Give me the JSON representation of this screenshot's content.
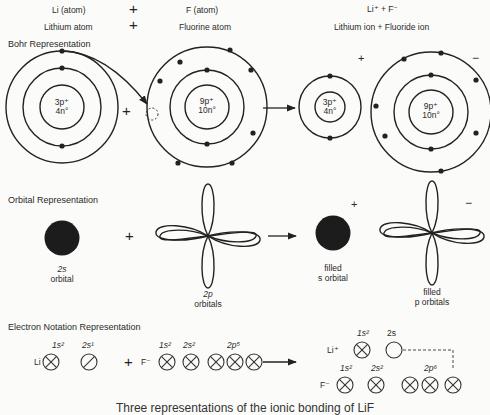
{
  "header": {
    "row1": {
      "reactant1": "Li (atom)",
      "plus": "+",
      "reactant2": "F (atom)",
      "product": "Li⁺ + F⁻"
    },
    "row2": {
      "reactant1": "Lithium atom",
      "plus": "+",
      "reactant2": "Fluorine atom",
      "product": "Lithium ion  +  Fluoride ion"
    }
  },
  "bohr": {
    "title": "Bohr Representation",
    "plus": "+",
    "li_atom": {
      "protons": "3p⁺",
      "neutrons": "4n°"
    },
    "f_atom": {
      "protons": "9p⁺",
      "neutrons": "10n°"
    },
    "li_ion": {
      "protons": "3p⁺",
      "neutrons": "4n°",
      "charge": "+"
    },
    "f_ion": {
      "protons": "9p⁺",
      "neutrons": "10n°",
      "charge": "−"
    }
  },
  "orbital": {
    "title": "Orbital Representation",
    "plus": "+",
    "s_orbital": {
      "line1": "2s",
      "line2": "orbital"
    },
    "p_orbitals": {
      "line1": "2p",
      "line2": "orbitals"
    },
    "filled_s": {
      "line1": "filled",
      "line2": "s orbital",
      "charge": "+"
    },
    "filled_p": {
      "line1": "filled",
      "line2": "p orbitals",
      "charge": "−"
    }
  },
  "electron_notation": {
    "title": "Electron Notation Representation",
    "li_label": "Li",
    "li_1s": "1s²",
    "li_2s": "2s¹",
    "plus": "+",
    "f_label": "F⁻",
    "f_1s": "1s²",
    "f_2s": "2s²",
    "f_2p": "2p⁵",
    "li_ion_label": "Li⁺",
    "li_ion_1s": "1s²",
    "li_ion_2s": "2s",
    "f_ion_label": "F⁻",
    "f_ion_1s": "1s²",
    "f_ion_2s": "2s²",
    "f_ion_2p": "2p⁶"
  },
  "caption": "Three representations of the ionic bonding of LiF"
}
